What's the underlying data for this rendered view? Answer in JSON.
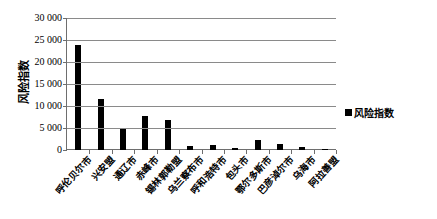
{
  "chart_data": {
    "type": "bar",
    "title": "",
    "xlabel": "",
    "ylabel": "风险指数",
    "ylim": [
      0,
      30000
    ],
    "ytick_step": 5000,
    "ytick_labels": [
      "30 000",
      "25 000",
      "20 000",
      "15 000",
      "10 000",
      "5 000",
      "0"
    ],
    "ytick_values": [
      30000,
      25000,
      20000,
      15000,
      10000,
      5000,
      0
    ],
    "grid": true,
    "legend_position": "right",
    "legend": [
      "风险指数"
    ],
    "bar_color": "#000000",
    "categories": [
      "呼伦贝尔市",
      "兴安盟",
      "通辽市",
      "赤峰市",
      "锡林郭勒盟",
      "乌兰察布市",
      "呼和浩特市",
      "包头市",
      "鄂尔多斯市",
      "巴彦淖尔市",
      "乌海市",
      "阿拉善盟"
    ],
    "series": [
      {
        "name": "风险指数",
        "values": [
          23800,
          11500,
          4800,
          7800,
          6900,
          900,
          1100,
          500,
          2200,
          1300,
          600,
          300
        ]
      }
    ]
  },
  "legend_label": "风险指数",
  "axis": {
    "y_title": "风险指数"
  }
}
